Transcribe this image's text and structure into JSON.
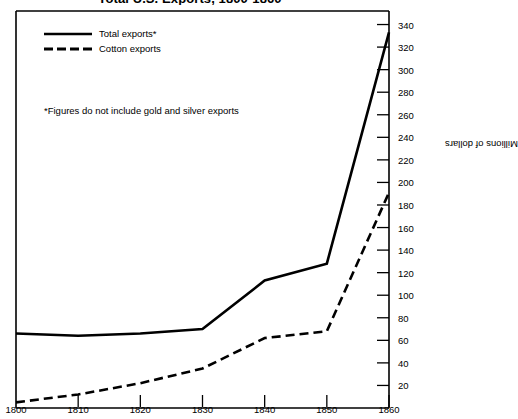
{
  "chart_data": {
    "type": "line",
    "title": "Total U.S. Exports, 1800-1860",
    "xlabel": "",
    "ylabel": "Millions of dollars",
    "x": [
      1800,
      1810,
      1820,
      1830,
      1840,
      1850,
      1860
    ],
    "xticks": [
      "1800",
      "1810",
      "1820",
      "1830",
      "1840",
      "1850",
      "1860"
    ],
    "xlim": [
      1800,
      1860
    ],
    "yticks": [
      "20",
      "40",
      "60",
      "80",
      "100",
      "120",
      "140",
      "160",
      "180",
      "200",
      "220",
      "240",
      "260",
      "280",
      "300",
      "320",
      "340"
    ],
    "ytick_values": [
      20,
      40,
      60,
      80,
      100,
      120,
      140,
      160,
      180,
      200,
      220,
      240,
      260,
      280,
      300,
      320,
      340
    ],
    "ylim": [
      0,
      352
    ],
    "grid": false,
    "legend_position": "upper-left",
    "series": [
      {
        "name": "Total exports*",
        "style": "solid",
        "color": "#000000",
        "values": [
          66,
          64,
          66,
          70,
          113,
          128,
          333
        ]
      },
      {
        "name": "Cotton exports",
        "style": "dashed",
        "color": "#000000",
        "values": [
          5,
          12,
          22,
          35,
          62,
          68,
          191
        ]
      }
    ],
    "annotations": [
      "*Figures do not include gold and silver exports"
    ]
  },
  "legend": {
    "items": [
      {
        "label": "Total exports*",
        "style": "solid"
      },
      {
        "label": "Cotton exports",
        "style": "dashed"
      }
    ]
  },
  "footnote": {
    "text": "*Figures do not include gold and silver exports"
  }
}
